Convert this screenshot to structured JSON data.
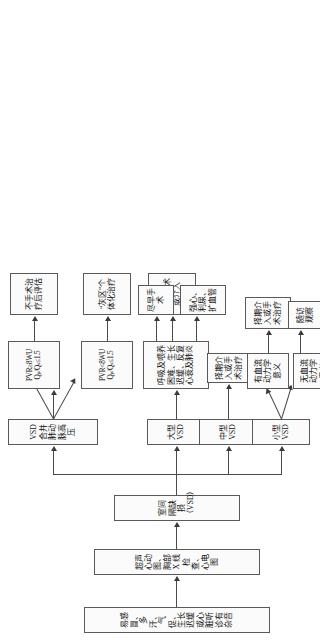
{
  "document": {
    "type": "clinical-flowchart",
    "topic": "室间隔缺损（VSD）诊断与治疗流程",
    "orientation": "page rotated 90 degrees counter-clockwise"
  },
  "nodes": {
    "symptoms": "易感冒、多汗、气促、生长迟缓或心脏听诊有杂音",
    "exams": "超声心动图、胸部 X 线检查、心电图",
    "diagnosis": "室间隔缺损（VSD）",
    "vsd_ph": "VSD 合并肺动脉高压",
    "large_vsd": "大型 VSD",
    "medium_vsd": "中型 VSD",
    "small_vsd": "小型 VSD",
    "pvr_ge8_qq_le15_line1": "PVR≥8WU",
    "pvr_ge8_qq_le15_line2": "Qₚ/Qₛ≤1.5",
    "pvr_lt8_qq_le15_line1": "PVR<8WU",
    "pvr_lt8_qq_le15_line2": "Qₚ/Qₛ≤1.5",
    "pvr_lt8_qq_gt15_line1": "PVR<8WU",
    "pvr_lt8_qq_gt15_line2": "Qₚ/Qₛ>1.5",
    "no_surgery_eval": "不手术治疗后评估",
    "gray_zone": "“灰区”个体化治疗",
    "elective_surgery_or_intervention": "择期手术或介入",
    "large_symptoms": "呼吸及喂养困难、生长迟缓、反复心衰及肺炎",
    "early_surgery": "尽早手术",
    "medical_therapy": "强心、利尿、扩血管",
    "medium_treatment": "择期介入或手术治疗",
    "hemodynamic_significant": "有血流动力学意义",
    "hemodynamic_insignificant": "无血流动力学意义",
    "small_treatment": "择期介入或手术治疗",
    "follow_up": "随访观察",
    "spontaneous_closure": "自然闭合"
  },
  "style": {
    "box_border_color": "#5a5a5a",
    "box_fill_color": "#fbfbfb",
    "line_color": "#4a4a4a",
    "text_color": "#111111",
    "page_background": "#ffffff"
  }
}
